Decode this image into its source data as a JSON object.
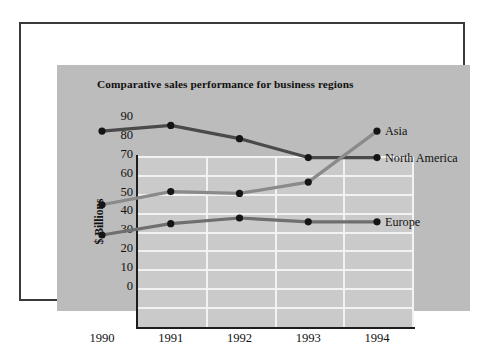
{
  "figure": {
    "title": "Comparative sales performance for business regions",
    "panel_color": "#bcbcbc",
    "plot_color": "#cacaca",
    "frame_color": "#3a3a3c",
    "gridline_color": "#f2f2f2"
  },
  "chart_data": {
    "type": "line",
    "title": "Comparative sales performance for business regions",
    "xlabel": "",
    "ylabel": "$ Billions",
    "categories": [
      "1990",
      "1991",
      "1992",
      "1993",
      "1994"
    ],
    "ylim": [
      0,
      90
    ],
    "yticks": [
      0,
      10,
      20,
      30,
      40,
      50,
      60,
      70,
      80,
      90
    ],
    "ytick_labels": [
      "0",
      "10",
      "20",
      "30",
      "40",
      "50",
      "60",
      "70",
      "80",
      "90"
    ],
    "grid": true,
    "legend_position": "right-inline-end-of-line",
    "series": [
      {
        "name": "North America",
        "values": [
          82,
          85,
          78,
          68,
          68
        ],
        "color": "#4a4a4a",
        "marker": "circle"
      },
      {
        "name": "Asia",
        "values": [
          43,
          50,
          49,
          55,
          82
        ],
        "color": "#8a8a8a",
        "marker": "circle"
      },
      {
        "name": "Europe",
        "values": [
          27,
          33,
          36,
          34,
          34
        ],
        "color": "#6f6f6f",
        "marker": "circle"
      }
    ],
    "annotations": [
      {
        "text": "Asia",
        "series": "Asia",
        "at_category": "1994",
        "value": 82
      },
      {
        "text": "North America",
        "series": "North America",
        "at_category": "1994",
        "value": 68
      },
      {
        "text": "Europe",
        "series": "Europe",
        "at_category": "1994",
        "value": 34
      }
    ]
  }
}
